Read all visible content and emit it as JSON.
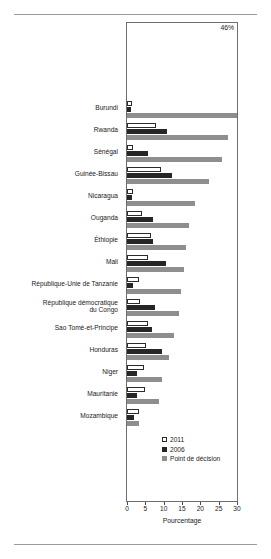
{
  "chart_data": {
    "type": "bar",
    "orientation": "horizontal",
    "title": "",
    "xlabel": "Pourcentage",
    "ylabel": "",
    "xlim": [
      0,
      30
    ],
    "xticks": [
      0,
      5,
      10,
      15,
      20,
      25,
      30
    ],
    "grid": false,
    "legend_position": "bottom-right",
    "categories": [
      "Burundi",
      "Rwanda",
      "Sénégal",
      "Guinée-Bissau",
      "Nicaragua",
      "Ouganda",
      "Éthiopie",
      "Mali",
      "République-Unie de Tanzanie",
      "République démocratique\ndu Congo",
      "Sao Tomé-et-Principe",
      "Honduras",
      "Niger",
      "Mauritanie",
      "Mozambique"
    ],
    "series": [
      {
        "name": "2011",
        "color": "#ffffff",
        "values": [
          1.4,
          7.8,
          1.6,
          9.4,
          1.6,
          4.2,
          6.6,
          5.6,
          3.4,
          3.6,
          5.6,
          5.2,
          4.6,
          5.0,
          3.2
        ]
      },
      {
        "name": "2006",
        "color": "#262626",
        "values": [
          1.0,
          10.8,
          5.6,
          12.4,
          1.3,
          7.2,
          7.2,
          10.6,
          1.7,
          7.6,
          6.8,
          9.6,
          2.6,
          2.6,
          2.0
        ]
      },
      {
        "name": "Point de décision",
        "color": "#8e8e8e",
        "values": [
          46.0,
          27.6,
          25.8,
          22.4,
          18.6,
          17.0,
          16.2,
          15.6,
          14.8,
          14.2,
          12.8,
          11.4,
          9.6,
          8.8,
          3.4
        ]
      }
    ],
    "annotations": [
      {
        "text": "46%",
        "series": "Point de décision",
        "category": "Burundi"
      }
    ]
  },
  "legend": {
    "items": [
      {
        "label": "2011",
        "swatch": "hollow-square-icon"
      },
      {
        "label": "2006",
        "swatch": "black-square-icon"
      },
      {
        "label": "Point de décision",
        "swatch": "gray-square-icon"
      }
    ]
  },
  "axis": {
    "x_title": "Pourcentage",
    "x_tick_labels": [
      "0",
      "5",
      "10",
      "15",
      "20",
      "25",
      "30"
    ]
  },
  "colors": {
    "series_2011": "#ffffff",
    "series_2006": "#262626",
    "series_point_decision": "#8e8e8e",
    "axis": "#6e6e6e",
    "text": "#1a1a1a"
  }
}
